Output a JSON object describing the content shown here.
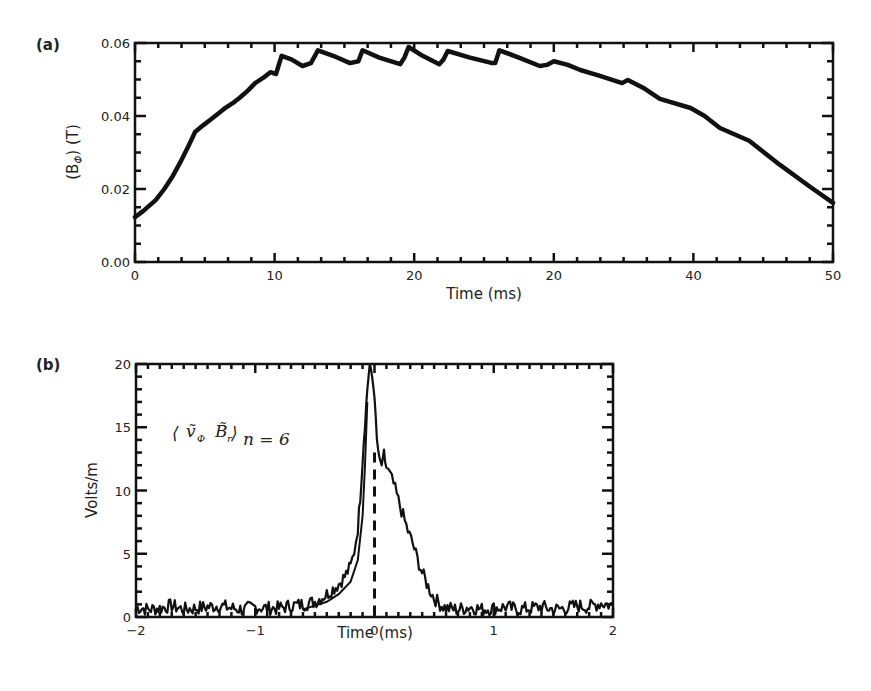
{
  "chart_data": [
    {
      "panel": "(a)",
      "type": "line",
      "title": "",
      "xlabel": "Time (ms)",
      "ylabel_prefix": "(B",
      "ylabel_sub": "Φ",
      "ylabel_suffix": ") (T)",
      "xlim": [
        0,
        50
      ],
      "ylim": [
        0,
        0.06
      ],
      "x_ticks": [
        0,
        10,
        20,
        30,
        40,
        50
      ],
      "x_tick_labels": [
        "0",
        "10",
        "20",
        "20",
        "40",
        "50"
      ],
      "y_ticks": [
        0,
        0.02,
        0.04,
        0.06
      ],
      "y_tick_labels": [
        "0.00",
        "0.02",
        "0.04",
        "0.06"
      ],
      "x_minor_per_major": 6,
      "y_minor_per_major": 4,
      "grid": false,
      "series": [
        {
          "name": "B_phi",
          "x": [
            0,
            0.6,
            1.5,
            2.1,
            2.7,
            3.2,
            3.8,
            4.3,
            4.9,
            5.4,
            5.9,
            6.4,
            7.0,
            7.5,
            8.1,
            8.6,
            9.2,
            9.7,
            10.1,
            10.5,
            11.2,
            12.0,
            12.6,
            13.1,
            14.2,
            15.4,
            16.0,
            16.3,
            17.5,
            19.0,
            19.3,
            19.6,
            20.6,
            21.8,
            22.1,
            22.4,
            24.0,
            25.6,
            25.8,
            26.1,
            27.5,
            29.0,
            29.5,
            30.0,
            31.0,
            31.9,
            33.3,
            34.9,
            35.3,
            36.5,
            37.6,
            39.8,
            40.8,
            41.9,
            44.0,
            46.2,
            48.4,
            50.0
          ],
          "y": [
            0.0123,
            0.014,
            0.017,
            0.02,
            0.0235,
            0.027,
            0.0315,
            0.0356,
            0.0375,
            0.039,
            0.0405,
            0.042,
            0.0435,
            0.045,
            0.047,
            0.049,
            0.0505,
            0.052,
            0.0515,
            0.0565,
            0.0555,
            0.0537,
            0.0545,
            0.058,
            0.0565,
            0.0545,
            0.055,
            0.058,
            0.056,
            0.0542,
            0.056,
            0.0589,
            0.0565,
            0.0542,
            0.0555,
            0.0578,
            0.056,
            0.0545,
            0.0545,
            0.058,
            0.056,
            0.0537,
            0.054,
            0.055,
            0.054,
            0.0526,
            0.051,
            0.049,
            0.0499,
            0.0475,
            0.0447,
            0.0422,
            0.04,
            0.0367,
            0.0332,
            0.0266,
            0.0205,
            0.0162
          ]
        }
      ]
    },
    {
      "panel": "(b)",
      "type": "line",
      "title": "",
      "xlabel": "Time (ms)",
      "ylabel": "Volts/m",
      "annotation": {
        "left_bracket": "⟨",
        "v": "ṽ",
        "v_sub": "Φ",
        "b": "B̃",
        "b_sub": "r",
        "right_bracket": "⟩",
        "n_sub": "n = 6"
      },
      "xlim": [
        -2,
        2
      ],
      "ylim": [
        0,
        20
      ],
      "x_ticks": [
        -2,
        -1,
        0,
        1,
        2
      ],
      "x_tick_labels": [
        "−2",
        "−1",
        "0",
        "1",
        "2"
      ],
      "y_ticks": [
        0,
        5,
        10,
        15,
        20
      ],
      "y_tick_labels": [
        "0",
        "5",
        "10",
        "15",
        "20"
      ],
      "x_minor_per_major": 10,
      "y_minor_per_major": 5,
      "grid": false,
      "vertical_reference_line": {
        "x": 0,
        "style": "dashed"
      },
      "series": [
        {
          "name": "correlation",
          "x": [
            -2.0,
            -1.9,
            -1.8,
            -1.7,
            -1.6,
            -1.5,
            -1.4,
            -1.3,
            -1.2,
            -1.1,
            -1.0,
            -0.9,
            -0.8,
            -0.7,
            -0.6,
            -0.5,
            -0.45,
            -0.4,
            -0.35,
            -0.3,
            -0.25,
            -0.2,
            -0.17,
            -0.14,
            -0.12,
            -0.1,
            -0.08,
            -0.06,
            -0.04,
            -0.02,
            0.0,
            0.02,
            0.04,
            0.06,
            0.08,
            0.1,
            0.13,
            0.16,
            0.2,
            0.24,
            0.28,
            0.32,
            0.36,
            0.4,
            0.45,
            0.5,
            0.55,
            0.6,
            0.7,
            0.8,
            0.9,
            1.0,
            1.1,
            1.2,
            1.3,
            1.4,
            1.5,
            1.6,
            1.7,
            1.8,
            1.9,
            2.0
          ],
          "y": [
            0.8,
            0.6,
            0.7,
            0.9,
            0.6,
            0.7,
            0.8,
            0.9,
            0.7,
            0.6,
            0.8,
            0.7,
            0.7,
            0.9,
            1.0,
            1.2,
            1.5,
            1.8,
            2.2,
            2.6,
            3.2,
            4.0,
            5.2,
            7.0,
            9.5,
            12.5,
            15.5,
            18.0,
            20.0,
            19.0,
            17.5,
            14.0,
            12.5,
            12.0,
            12.8,
            11.8,
            11.2,
            10.5,
            9.2,
            8.0,
            6.8,
            5.8,
            4.6,
            3.5,
            2.4,
            1.5,
            1.0,
            0.7,
            0.6,
            0.8,
            0.6,
            0.7,
            0.8,
            0.6,
            0.7,
            0.8,
            0.6,
            0.7,
            0.9,
            0.8,
            1.1,
            0.9
          ]
        },
        {
          "name": "correlation-lower-envelope",
          "x": [
            -0.6,
            -0.4,
            -0.3,
            -0.2,
            -0.14,
            -0.1,
            -0.08,
            -0.06
          ],
          "y": [
            0.6,
            1.2,
            1.8,
            2.8,
            4.5,
            8.0,
            12.0,
            17.0
          ]
        }
      ]
    }
  ]
}
